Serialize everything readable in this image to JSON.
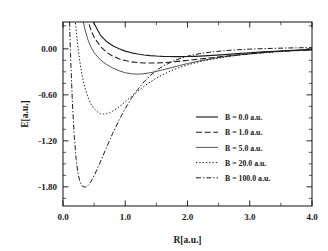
{
  "figure": {
    "background_color": "#ffffff",
    "line_color": "#1b1b1b"
  },
  "chart_data": {
    "type": "line",
    "title": "",
    "xlabel": "R[a.u.]",
    "ylabel": "E[a.u.]",
    "xlim": [
      0.0,
      4.0
    ],
    "ylim": [
      -2.05,
      0.35
    ],
    "grid": false,
    "legend_position": "center-right",
    "xticks": [
      0.0,
      1.0,
      2.0,
      3.0,
      4.0
    ],
    "xtick_labels": [
      "0.0",
      "1.0",
      "2.0",
      "3.0",
      "4.0"
    ],
    "xticks_minor": [
      0.5,
      1.5,
      2.5,
      3.5
    ],
    "yticks": [
      0.0,
      -0.6,
      -1.2,
      -1.8
    ],
    "ytick_labels": [
      "0.00",
      "-0.60",
      "-1.20",
      "-1.80"
    ],
    "yticks_minor": [
      0.3,
      -0.15,
      -0.3,
      -0.45,
      -0.75,
      -0.9,
      -1.05,
      -1.35,
      -1.5,
      -1.65,
      -1.95
    ],
    "series": [
      {
        "name": "B = 0.0 a.u.",
        "linestyle": "solid",
        "dasharray": "",
        "width": 1.15,
        "minimum": {
          "R": 2.0,
          "E": -0.1
        },
        "x": [
          0.25,
          0.3,
          0.35,
          0.4,
          0.45,
          0.5,
          0.6,
          0.7,
          0.8,
          0.9,
          1.0,
          1.1,
          1.2,
          1.3,
          1.4,
          1.5,
          1.6,
          1.7,
          1.8,
          1.9,
          2.0,
          2.1,
          2.2,
          2.4,
          2.6,
          2.8,
          3.0,
          3.2,
          3.4,
          3.6,
          3.8,
          4.0
        ],
        "y": [
          2.1,
          1.35,
          0.9,
          0.62,
          0.45,
          0.33,
          0.18,
          0.095,
          0.04,
          0.0,
          -0.03,
          -0.052,
          -0.068,
          -0.08,
          -0.088,
          -0.094,
          -0.098,
          -0.1,
          -0.101,
          -0.101,
          -0.1,
          -0.098,
          -0.095,
          -0.086,
          -0.075,
          -0.063,
          -0.051,
          -0.04,
          -0.031,
          -0.023,
          -0.016,
          -0.01
        ]
      },
      {
        "name": "B = 1.0 a.u.",
        "linestyle": "dashed",
        "dasharray": "6,2.6",
        "width": 1.05,
        "minimum": {
          "R": 1.35,
          "E": -0.185
        },
        "x": [
          0.2,
          0.25,
          0.3,
          0.35,
          0.4,
          0.45,
          0.5,
          0.6,
          0.7,
          0.8,
          0.9,
          1.0,
          1.1,
          1.2,
          1.3,
          1.4,
          1.5,
          1.6,
          1.7,
          1.8,
          1.9,
          2.0,
          2.2,
          2.4,
          2.6,
          2.8,
          3.0,
          3.2,
          3.4,
          3.6,
          3.8,
          4.0
        ],
        "y": [
          2.1,
          1.3,
          0.84,
          0.55,
          0.37,
          0.24,
          0.15,
          0.032,
          -0.045,
          -0.096,
          -0.13,
          -0.153,
          -0.17,
          -0.18,
          -0.185,
          -0.186,
          -0.184,
          -0.18,
          -0.174,
          -0.167,
          -0.159,
          -0.151,
          -0.133,
          -0.115,
          -0.097,
          -0.08,
          -0.065,
          -0.051,
          -0.039,
          -0.029,
          -0.02,
          -0.013
        ]
      },
      {
        "name": "B = 5.0 a.u.",
        "linestyle": "solid-thin",
        "dasharray": "",
        "width": 0.75,
        "minimum": {
          "R": 1.1,
          "E": -0.33
        },
        "x": [
          0.15,
          0.2,
          0.25,
          0.3,
          0.35,
          0.4,
          0.45,
          0.5,
          0.6,
          0.7,
          0.8,
          0.9,
          1.0,
          1.1,
          1.2,
          1.3,
          1.4,
          1.5,
          1.6,
          1.7,
          1.8,
          2.0,
          2.2,
          2.4,
          2.6,
          2.8,
          3.0,
          3.2,
          3.4,
          3.6,
          3.8,
          4.0
        ],
        "y": [
          2.1,
          1.25,
          0.76,
          0.46,
          0.26,
          0.12,
          0.022,
          -0.05,
          -0.145,
          -0.205,
          -0.25,
          -0.285,
          -0.312,
          -0.325,
          -0.33,
          -0.325,
          -0.312,
          -0.295,
          -0.275,
          -0.254,
          -0.233,
          -0.192,
          -0.157,
          -0.127,
          -0.102,
          -0.081,
          -0.064,
          -0.049,
          -0.037,
          -0.027,
          -0.018,
          -0.011
        ]
      },
      {
        "name": "B = 20.0 a.u.",
        "linestyle": "dotted",
        "dasharray": "1.4,1.9",
        "width": 1.0,
        "minimum": {
          "R": 0.62,
          "E": -0.85
        },
        "x": [
          0.1,
          0.13,
          0.16,
          0.2,
          0.24,
          0.28,
          0.32,
          0.36,
          0.4,
          0.45,
          0.5,
          0.55,
          0.6,
          0.65,
          0.7,
          0.75,
          0.8,
          0.9,
          1.0,
          1.1,
          1.2,
          1.3,
          1.4,
          1.5,
          1.6,
          1.8,
          2.0,
          2.2,
          2.4,
          2.6,
          2.8,
          3.0,
          3.2,
          3.4,
          3.6,
          3.8,
          4.0
        ],
        "y": [
          2.1,
          1.35,
          0.82,
          0.34,
          0.02,
          -0.22,
          -0.4,
          -0.53,
          -0.63,
          -0.72,
          -0.78,
          -0.82,
          -0.845,
          -0.85,
          -0.845,
          -0.832,
          -0.812,
          -0.757,
          -0.69,
          -0.62,
          -0.553,
          -0.49,
          -0.433,
          -0.382,
          -0.337,
          -0.264,
          -0.209,
          -0.167,
          -0.134,
          -0.107,
          -0.085,
          -0.067,
          -0.052,
          -0.039,
          -0.028,
          -0.019,
          -0.012
        ]
      },
      {
        "name": "B = 100.0 a.u.",
        "linestyle": "dashdot",
        "dasharray": "5,2,1.3,2",
        "width": 1.0,
        "minimum": {
          "R": 0.37,
          "E": -1.8
        },
        "x": [
          0.06,
          0.08,
          0.1,
          0.12,
          0.15,
          0.18,
          0.21,
          0.24,
          0.27,
          0.3,
          0.33,
          0.36,
          0.39,
          0.42,
          0.45,
          0.5,
          0.55,
          0.6,
          0.7,
          0.8,
          0.9,
          1.0,
          1.1,
          1.2,
          1.3,
          1.4,
          1.5,
          1.6,
          1.8,
          2.0,
          2.2,
          2.4,
          2.6,
          2.8,
          3.0,
          3.2,
          3.4,
          3.6,
          3.8,
          4.0
        ],
        "y": [
          2.1,
          1.2,
          0.5,
          -0.06,
          -0.68,
          -1.13,
          -1.43,
          -1.62,
          -1.73,
          -1.785,
          -1.8,
          -1.802,
          -1.79,
          -1.765,
          -1.73,
          -1.655,
          -1.568,
          -1.475,
          -1.285,
          -1.1,
          -0.93,
          -0.78,
          -0.645,
          -0.53,
          -0.432,
          -0.35,
          -0.283,
          -0.228,
          -0.148,
          -0.096,
          -0.062,
          -0.039,
          -0.024,
          -0.012,
          -0.004,
          0.002,
          0.007,
          0.011,
          0.014,
          0.016
        ]
      }
    ]
  },
  "legend": {
    "entries": [
      {
        "label": "B = 0.0 a.u."
      },
      {
        "label": "B = 1.0 a.u."
      },
      {
        "label": "B = 5.0 a.u."
      },
      {
        "label": "B = 20.0 a.u."
      },
      {
        "label": "B = 100.0 a.u."
      }
    ]
  },
  "axes": {
    "x_title": "R[a.u.]",
    "y_title": "E[a.u.]",
    "x_tick_labels": [
      "0.0",
      "1.0",
      "2.0",
      "3.0",
      "4.0"
    ],
    "y_tick_labels": [
      "0.00",
      "-0.60",
      "-1.20",
      "-1.80"
    ]
  }
}
